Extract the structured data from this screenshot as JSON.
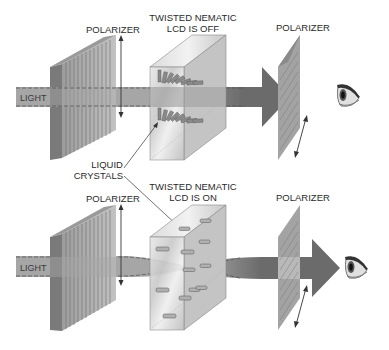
{
  "diagram": {
    "top_panel": {
      "state": "off",
      "light_label": "LIGHT",
      "front_polarizer_label": "POLARIZER",
      "lcd_label_line1": "TWISTED NEMATIC",
      "lcd_label_line2": "LCD IS OFF",
      "rear_polarizer_label": "POLARIZER",
      "output": "light passes through to eye"
    },
    "shared": {
      "crystals_label_line1": "LIQUID",
      "crystals_label_line2": "CRYSTALS"
    },
    "bottom_panel": {
      "state": "on",
      "light_label": "LIGHT",
      "front_polarizer_label": "POLARIZER",
      "lcd_label_line1": "TWISTED NEMATIC",
      "lcd_label_line2": "LCD IS ON",
      "rear_polarizer_label": "POLARIZER",
      "output": "light beam narrows through crystals"
    },
    "icons": {
      "eye_top": "eye-icon",
      "eye_bottom": "eye-icon"
    },
    "colors": {
      "beam": "#9a9a9a",
      "beam_dark": "#5e5e5e",
      "polarizer": "#8c8c8c",
      "glass": "#d8d8d8",
      "text": "#2a2a2a"
    }
  }
}
